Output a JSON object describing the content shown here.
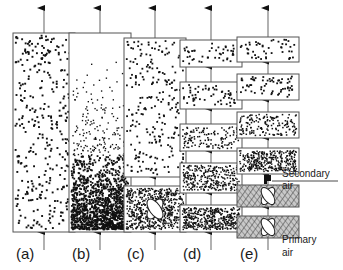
{
  "figure": {
    "type": "schematic-diagram",
    "background_color": "#ffffff",
    "ink_color": "#1a1a1a",
    "box_stroke_color": "#555555",
    "grate_fill_color": "#c9c9c9",
    "arrow_color": "#111111",
    "pipe_color": "#888888",
    "width": 343,
    "height": 270
  },
  "panels": [
    {
      "id": "a",
      "label": "(a)",
      "label_x": 16,
      "label_y": 259,
      "axis_x": 44,
      "description": "single tall column, uniform dot density",
      "outlet_arrow": {
        "x": 44,
        "y_top": 8,
        "y_bottom": 33
      },
      "inlet_arrow": {
        "x": 44,
        "y_top": 232,
        "y_bottom": 250
      },
      "boxes": [
        {
          "x": 13,
          "y": 33,
          "w": 62,
          "h": 199,
          "density": "uniform-medium",
          "dots": 330,
          "gradient": false,
          "grate": false,
          "fill": "#ffffff"
        }
      ]
    },
    {
      "id": "b",
      "label": "(b)",
      "label_x": 72,
      "label_y": 259,
      "axis_x": 100,
      "description": "single tall column, dense dilute-phase gradient, dense bottom",
      "outlet_arrow": {
        "x": 100,
        "y_top": 8,
        "y_bottom": 33
      },
      "inlet_arrow": {
        "x": 100,
        "y_top": 232,
        "y_bottom": 250
      },
      "boxes": [
        {
          "x": 69,
          "y": 33,
          "w": 62,
          "h": 199,
          "density": "gradient-dense-bottom",
          "dots": 1500,
          "gradient": true,
          "grate": false,
          "fill": "#ffffff"
        }
      ]
    },
    {
      "id": "c",
      "label": "(c)",
      "label_x": 127,
      "label_y": 259,
      "axis_x": 155,
      "description": "tall dilute riser above a dense grate box with distributor X",
      "outlet_arrow": {
        "x": 155,
        "y_top": 8,
        "y_bottom": 38
      },
      "inlet_arrow": {
        "x": 155,
        "y_top": 232,
        "y_bottom": 250
      },
      "boxes": [
        {
          "x": 124,
          "y": 38,
          "w": 62,
          "h": 139,
          "density": "sparse",
          "dots": 230,
          "gradient": false,
          "grate": false,
          "fill": "#ffffff"
        },
        {
          "x": 124,
          "y": 186,
          "w": 62,
          "h": 46,
          "density": "very-dense",
          "dots": 620,
          "gradient": false,
          "grate": true,
          "fill": "#ffffff"
        }
      ],
      "internal_arrows": [
        {
          "x": 155,
          "y_top": 177,
          "y_bottom": 186
        }
      ]
    },
    {
      "id": "d",
      "label": "(d)",
      "label_x": 183,
      "label_y": 259,
      "axis_x": 211,
      "description": "five stacked stages, density increasing downward",
      "outlet_arrow": {
        "x": 211,
        "y_top": 8,
        "y_bottom": 40
      },
      "inlet_arrow": {
        "x": 211,
        "y_top": 232,
        "y_bottom": 250
      },
      "boxes": [
        {
          "x": 180,
          "y": 40,
          "w": 62,
          "h": 27,
          "density": "sparse",
          "dots": 48,
          "gradient": false,
          "grate": false,
          "fill": "#ffffff"
        },
        {
          "x": 180,
          "y": 82,
          "w": 62,
          "h": 27,
          "density": "sparse",
          "dots": 58,
          "gradient": false,
          "grate": false,
          "fill": "#ffffff"
        },
        {
          "x": 180,
          "y": 124,
          "w": 62,
          "h": 27,
          "density": "medium",
          "dots": 130,
          "gradient": false,
          "grate": false,
          "fill": "#ffffff"
        },
        {
          "x": 180,
          "y": 163,
          "w": 62,
          "h": 30,
          "density": "dense",
          "dots": 300,
          "gradient": false,
          "grate": false,
          "fill": "#ffffff"
        },
        {
          "x": 180,
          "y": 205,
          "w": 62,
          "h": 27,
          "density": "very-dense",
          "dots": 420,
          "gradient": false,
          "grate": false,
          "fill": "#ffffff"
        }
      ],
      "internal_arrows": [
        {
          "x": 211,
          "y_top": 67,
          "y_bottom": 82
        },
        {
          "x": 211,
          "y_top": 109,
          "y_bottom": 124
        },
        {
          "x": 211,
          "y_top": 151,
          "y_bottom": 163
        },
        {
          "x": 211,
          "y_top": 193,
          "y_bottom": 205
        }
      ]
    },
    {
      "id": "e",
      "label": "(e)",
      "label_x": 240,
      "label_y": 259,
      "axis_x": 268,
      "description": "six stacked stages; lower two are grate boxes fed by primary air, secondary air injected above them",
      "outlet_arrow": {
        "x": 268,
        "y_top": 8,
        "y_bottom": 37
      },
      "inlet_arrow": {
        "x": 268,
        "y_top": 232,
        "y_bottom": 250
      },
      "boxes": [
        {
          "x": 237,
          "y": 37,
          "w": 62,
          "h": 25,
          "density": "sparse",
          "dots": 46,
          "gradient": false,
          "grate": false,
          "fill": "#ffffff"
        },
        {
          "x": 237,
          "y": 74,
          "w": 62,
          "h": 26,
          "density": "sparse",
          "dots": 62,
          "gradient": false,
          "grate": false,
          "fill": "#ffffff"
        },
        {
          "x": 237,
          "y": 112,
          "w": 62,
          "h": 26,
          "density": "medium",
          "dots": 150,
          "gradient": false,
          "grate": false,
          "fill": "#ffffff"
        },
        {
          "x": 237,
          "y": 148,
          "w": 62,
          "h": 26,
          "density": "dense",
          "dots": 330,
          "gradient": false,
          "grate": false,
          "fill": "#ffffff"
        },
        {
          "x": 237,
          "y": 185,
          "w": 62,
          "h": 22,
          "density": "grate",
          "dots": 0,
          "gradient": false,
          "grate": true,
          "fill": "#c9c9c9"
        },
        {
          "x": 237,
          "y": 216,
          "w": 62,
          "h": 22,
          "density": "grate",
          "dots": 0,
          "gradient": false,
          "grate": true,
          "fill": "#c9c9c9"
        }
      ],
      "internal_arrows": [
        {
          "x": 268,
          "y_top": 62,
          "y_bottom": 74
        },
        {
          "x": 268,
          "y_top": 100,
          "y_bottom": 112
        },
        {
          "x": 268,
          "y_top": 138,
          "y_bottom": 148
        },
        {
          "x": 268,
          "y_top": 174,
          "y_bottom": 185
        },
        {
          "x": 268,
          "y_top": 207,
          "y_bottom": 216
        }
      ]
    }
  ],
  "annotations": [
    {
      "id": "secondary-air",
      "line1": "Secondary",
      "line2": "air",
      "text_x": 282,
      "text_y1": 177,
      "text_y2": 189,
      "leader": {
        "x1": 338,
        "y1": 181,
        "x2": 272,
        "y2": 181
      },
      "nozzle": {
        "x": 264,
        "y": 178
      }
    },
    {
      "id": "primary-air",
      "line1": "Primary",
      "line2": "air",
      "text_x": 282,
      "text_y1": 243,
      "text_y2": 256,
      "leader": null,
      "nozzle": null
    }
  ]
}
